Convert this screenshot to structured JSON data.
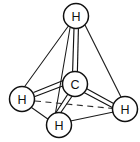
{
  "figure": {
    "name": "methane-tetrahedral-structure",
    "background_color": "#ffffff",
    "line_color": "#111111",
    "width": 140,
    "height": 142
  },
  "atoms": {
    "center": {
      "label": "C",
      "cx": 75,
      "cy": 84,
      "r": 12.5
    },
    "top": {
      "label": "H",
      "cx": 76,
      "cy": 16,
      "r": 12.5
    },
    "left": {
      "label": "H",
      "cx": 22,
      "cy": 99,
      "r": 12.5
    },
    "right": {
      "label": "H",
      "cx": 125,
      "cy": 109,
      "r": 12.5
    },
    "bottom": {
      "label": "H",
      "cx": 59,
      "cy": 125,
      "r": 12.5
    }
  },
  "bonds": [
    {
      "name": "bond-c-h-top",
      "style": "double-line",
      "from": "center",
      "to": "top"
    },
    {
      "name": "bond-c-h-left",
      "style": "double-line",
      "from": "center",
      "to": "left"
    },
    {
      "name": "bond-c-h-bottom",
      "style": "double-line",
      "from": "center",
      "to": "bottom"
    },
    {
      "name": "bond-c-h-right",
      "style": "double-line",
      "from": "center",
      "to": "right"
    }
  ],
  "tetrahedron_edges": [
    {
      "name": "edge-top-left",
      "style": "solid"
    },
    {
      "name": "edge-top-right",
      "style": "solid"
    },
    {
      "name": "edge-top-bottom",
      "style": "solid"
    },
    {
      "name": "edge-left-bottom",
      "style": "solid"
    },
    {
      "name": "edge-bottom-right",
      "style": "solid"
    },
    {
      "name": "edge-left-right",
      "style": "dashed"
    }
  ]
}
